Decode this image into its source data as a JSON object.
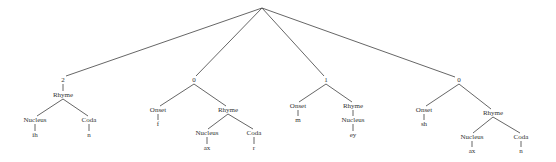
{
  "diagram": {
    "type": "syllable-structure-tree",
    "root": {
      "x": 262,
      "y": 8
    },
    "edge_color": "#555555",
    "text_color": "#333333",
    "syllables": [
      {
        "stress": "2",
        "pos": [
          63,
          80
        ],
        "nodes": [
          {
            "id": "rhyme",
            "label": "Rhyme",
            "pos": [
              63,
              95
            ]
          },
          {
            "id": "nucleus",
            "label": "Nucleus",
            "pos": [
              35,
              120
            ]
          },
          {
            "id": "nucleus-phone",
            "label": "ih",
            "pos": [
              35,
              135
            ]
          },
          {
            "id": "coda",
            "label": "Coda",
            "pos": [
              89,
              120
            ]
          },
          {
            "id": "coda-phone",
            "label": "n",
            "pos": [
              89,
              135
            ]
          }
        ]
      },
      {
        "stress": "0",
        "pos": [
          194,
          80
        ],
        "nodes": [
          {
            "id": "onset",
            "label": "Onset",
            "pos": [
              158,
              110
            ]
          },
          {
            "id": "onset-phone",
            "label": "f",
            "pos": [
              158,
              124
            ]
          },
          {
            "id": "rhyme",
            "label": "Rhyme",
            "pos": [
              228,
              110
            ]
          },
          {
            "id": "nucleus",
            "label": "Nucleus",
            "pos": [
              207,
              133
            ]
          },
          {
            "id": "nucleus-phone",
            "label": "ax",
            "pos": [
              207,
              148
            ]
          },
          {
            "id": "coda",
            "label": "Coda",
            "pos": [
              254,
              133
            ]
          },
          {
            "id": "coda-phone",
            "label": "r",
            "pos": [
              254,
              148
            ]
          }
        ]
      },
      {
        "stress": "1",
        "pos": [
          326,
          80
        ],
        "nodes": [
          {
            "id": "onset",
            "label": "Onset",
            "pos": [
              298,
              106
            ]
          },
          {
            "id": "onset-phone",
            "label": "m",
            "pos": [
              298,
              120
            ]
          },
          {
            "id": "rhyme",
            "label": "Rhyme",
            "pos": [
              353,
              106
            ]
          },
          {
            "id": "nucleus",
            "label": "Nucleus",
            "pos": [
              353,
              120
            ]
          },
          {
            "id": "nucleus-phone",
            "label": "ey",
            "pos": [
              353,
              135
            ]
          }
        ]
      },
      {
        "stress": "0",
        "pos": [
          459,
          80
        ],
        "nodes": [
          {
            "id": "onset",
            "label": "Onset",
            "pos": [
              424,
              110
            ]
          },
          {
            "id": "onset-phone",
            "label": "sh",
            "pos": [
              424,
              124
            ]
          },
          {
            "id": "rhyme",
            "label": "Rhyme",
            "pos": [
              493,
              113
            ]
          },
          {
            "id": "nucleus",
            "label": "Nucleus",
            "pos": [
              472,
              137
            ]
          },
          {
            "id": "nucleus-phone",
            "label": "ax",
            "pos": [
              472,
              151
            ]
          },
          {
            "id": "coda",
            "label": "Coda",
            "pos": [
              521,
              137
            ]
          },
          {
            "id": "coda-phone",
            "label": "n",
            "pos": [
              521,
              151
            ]
          }
        ]
      }
    ]
  }
}
